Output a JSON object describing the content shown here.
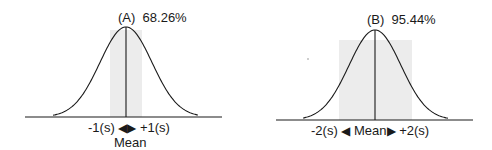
{
  "chart_data": [
    {
      "type": "area",
      "title": "(A) 68.26%",
      "panel": "A",
      "percent": "68.26%",
      "distribution": "normal",
      "shaded_range_sd": [
        -1,
        1
      ],
      "annotations": {
        "left": "-1(s)",
        "right": "+1(s)",
        "center": "Mean"
      },
      "xlabel": "",
      "ylabel": "",
      "grid": false,
      "colors": {
        "curve": "#1a1a1a",
        "shade": "#ececec",
        "axis": "#1a1a1a"
      }
    },
    {
      "type": "area",
      "title": "(B) 95.44%",
      "panel": "B",
      "percent": "95.44%",
      "distribution": "normal",
      "shaded_range_sd": [
        -2,
        2
      ],
      "annotations": {
        "left": "-2(s)",
        "right": "+2(s)",
        "center": "Mean"
      },
      "xlabel": "",
      "ylabel": "",
      "grid": false,
      "colors": {
        "curve": "#1a1a1a",
        "shade": "#ececec",
        "axis": "#1a1a1a"
      }
    }
  ],
  "panelA": {
    "title_letter": "(A)",
    "title_percent": "68.26%",
    "left_label": "-1(s)",
    "right_label": "+1(s)",
    "center_label": "Mean",
    "arrow_left": "◀",
    "arrow_right": "▶"
  },
  "panelB": {
    "title_letter": "(B)",
    "title_percent": "95.44%",
    "left_label": "-2(s)",
    "right_label": "+2(s)",
    "center_label": "Mean",
    "arrow_left": "◀",
    "arrow_right": "▶"
  }
}
